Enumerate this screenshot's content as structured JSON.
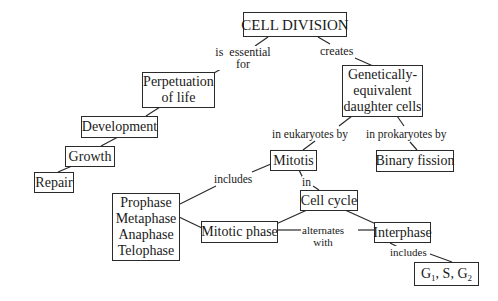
{
  "diagram": {
    "type": "concept-map",
    "nodes": {
      "cell_division": "CELL DIVISION",
      "perpetuation": [
        "Perpetuation",
        "of life"
      ],
      "development": "Development",
      "growth": "Growth",
      "repair": "Repair",
      "daughter_cells": [
        "Genetically-",
        "equivalent",
        "daughter cells"
      ],
      "mitotis": "Mitotis",
      "binary_fission": "Binary fission",
      "phases": [
        "Prophase",
        "Metaphase",
        "Anaphase",
        "Telophase"
      ],
      "cell_cycle": "Cell cycle",
      "mitotic_phase": "Mitotic phase",
      "interphase": "Interphase",
      "g_phases": {
        "g1": "G",
        "g1_sub": "1",
        "s": ", S, ",
        "g2": "G",
        "g2_sub": "2"
      }
    },
    "links": {
      "is_essential_for": [
        "is  essential",
        "for"
      ],
      "creates": "creates",
      "in_eukaryotes_by": "in eukaryotes by",
      "in_prokaryotes_by": "in prokaryotes by",
      "includes_phases": "includes",
      "in": "in",
      "alternates_with": [
        "alternates",
        "with"
      ],
      "includes_g": "includes"
    },
    "edges": [
      {
        "from": "CELL DIVISION",
        "label": "is essential for",
        "to": "Perpetuation of life"
      },
      {
        "from": "CELL DIVISION",
        "label": "creates",
        "to": "Genetically-equivalent daughter cells"
      },
      {
        "from": "Perpetuation of life",
        "label": "",
        "to": "Development"
      },
      {
        "from": "Development",
        "label": "",
        "to": "Growth"
      },
      {
        "from": "Growth",
        "label": "",
        "to": "Repair"
      },
      {
        "from": "Genetically-equivalent daughter cells",
        "label": "in eukaryotes by",
        "to": "Mitotis"
      },
      {
        "from": "Genetically-equivalent daughter cells",
        "label": "in prokaryotes by",
        "to": "Binary fission"
      },
      {
        "from": "Mitotis",
        "label": "includes",
        "to": "Prophase Metaphase Anaphase Telophase"
      },
      {
        "from": "Mitotis",
        "label": "in",
        "to": "Cell cycle"
      },
      {
        "from": "Cell cycle",
        "label": "",
        "to": "Mitotic phase"
      },
      {
        "from": "Cell cycle",
        "label": "",
        "to": "Interphase"
      },
      {
        "from": "Mitotic phase",
        "label": "alternates with",
        "to": "Interphase"
      },
      {
        "from": "Mitotic phase",
        "label": "",
        "to": "Prophase Metaphase Anaphase Telophase"
      },
      {
        "from": "Interphase",
        "label": "includes",
        "to": "G1, S, G2"
      }
    ]
  }
}
